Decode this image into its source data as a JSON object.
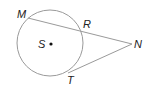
{
  "diagram": {
    "type": "geometry-circle-secant-tangent",
    "circle": {
      "center_label": "S",
      "cx": 50,
      "cy": 43,
      "r": 33
    },
    "points": {
      "M": {
        "label": "M",
        "x": 28,
        "y": 18
      },
      "R": {
        "label": "R",
        "x": 82,
        "y": 31
      },
      "N": {
        "label": "N",
        "x": 132,
        "y": 44
      },
      "T": {
        "label": "T",
        "x": 68,
        "y": 73
      },
      "S": {
        "label": "S",
        "x": 51,
        "y": 44
      }
    },
    "segments": [
      {
        "from": "M",
        "to": "N",
        "kind": "secant"
      },
      {
        "from": "T",
        "to": "N",
        "kind": "tangent"
      }
    ],
    "colors": {
      "stroke": "#999999",
      "text": "#222222"
    }
  }
}
